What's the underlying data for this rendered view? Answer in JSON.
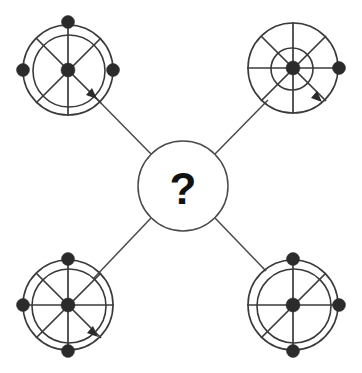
{
  "diagram": {
    "type": "radial-pattern-puzzle",
    "canvas": {
      "width": 362,
      "height": 373,
      "background": "#ffffff"
    },
    "colors": {
      "stroke": "#3a3a3a",
      "connector": "#4a4a4a",
      "dot_fill": "#2b2b2b",
      "center_fill": "#ffffff",
      "text": "#111111"
    },
    "center": {
      "label": "?",
      "cx": 183,
      "cy": 186,
      "r": 45
    },
    "nodes": [
      {
        "id": "top-left",
        "name": "wheel-top-left",
        "cx": 68,
        "cy": 70,
        "outer_r": 45,
        "inner_r": 36,
        "spokes": [
          "vertical",
          "diagonal-nw-se",
          "diagonal-ne-sw"
        ],
        "spoke_count": 3,
        "dots": [
          "center",
          "top",
          "left",
          "right"
        ],
        "dot_count": 4,
        "arrow": "outward-southeast",
        "arrow_angle_deg": 45
      },
      {
        "id": "top-right",
        "name": "wheel-top-right",
        "cx": 293,
        "cy": 68,
        "outer_r": 45,
        "inner_r": 21,
        "spokes": [
          "vertical",
          "horizontal",
          "diagonal-nw-se",
          "diagonal-ne-sw"
        ],
        "spoke_count": 4,
        "dots": [
          "center",
          "right"
        ],
        "dot_count": 2,
        "arrow": "outward-southeast",
        "arrow_angle_deg": 45
      },
      {
        "id": "bottom-left",
        "name": "wheel-bottom-left",
        "cx": 68,
        "cy": 305,
        "outer_r": 45,
        "inner_r": 37,
        "spokes": [
          "vertical",
          "horizontal",
          "diagonal-nw-se",
          "diagonal-ne-sw"
        ],
        "spoke_count": 4,
        "dots": [
          "center",
          "top",
          "bottom",
          "left"
        ],
        "dot_count": 4,
        "arrow": "outward-southeast",
        "arrow_angle_deg": 45
      },
      {
        "id": "bottom-right",
        "name": "wheel-bottom-right",
        "cx": 293,
        "cy": 305,
        "outer_r": 45,
        "inner_r": 37,
        "spokes": [
          "vertical",
          "horizontal",
          "diagonal-ne-sw"
        ],
        "spoke_count": 3,
        "dots": [
          "center",
          "top",
          "bottom",
          "right"
        ],
        "dot_count": 4,
        "arrow": "none"
      }
    ],
    "connectors": [
      {
        "from": "center",
        "to": "top-left",
        "has_arrow": true
      },
      {
        "from": "center",
        "to": "top-right",
        "has_arrow": true
      },
      {
        "from": "center",
        "to": "bottom-left",
        "has_arrow": true
      },
      {
        "from": "center",
        "to": "bottom-right",
        "has_arrow": false
      }
    ]
  }
}
